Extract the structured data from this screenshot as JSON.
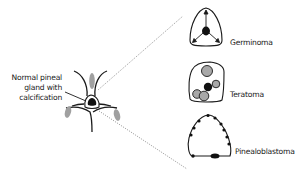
{
  "main_structure": {
    "label_lines": [
      "Normal pineal",
      "gland with",
      "calcification"
    ]
  },
  "tumors": [
    {
      "name": "Germinoma",
      "feature": "central calcification displaced peripherally (arrows)"
    },
    {
      "name": "Teratoma",
      "feature": "multiple calcifications"
    },
    {
      "name": "Pinealoblastoma",
      "feature": "peripheral calcifications"
    }
  ],
  "colors": {
    "line": "#1a1a1a",
    "gray_fill": "#a0a0a0",
    "dotted_line": "#9a9a9a"
  }
}
